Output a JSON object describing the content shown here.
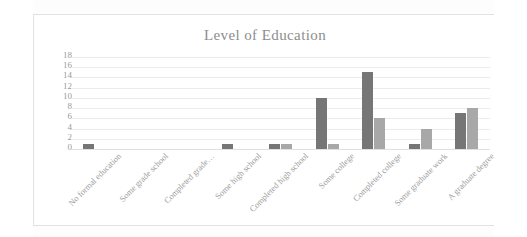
{
  "chart_data": {
    "type": "bar",
    "title": "Level of Education",
    "xlabel": "",
    "ylabel": "",
    "ylim": [
      0,
      18
    ],
    "grid": true,
    "legend": "none",
    "yticks": [
      18,
      16,
      14,
      12,
      10,
      8,
      6,
      4,
      2,
      0
    ],
    "categories": [
      "No formal education",
      "Some grade school",
      "Completed grade…",
      "Some high school",
      "Completed high school",
      "Some college",
      "Completed college",
      "Some graduate work",
      "A graduate degree"
    ],
    "series": [
      {
        "name": "Series 1",
        "color": "#767676",
        "values": [
          1,
          0,
          0,
          1,
          1,
          10,
          15,
          1,
          7
        ]
      },
      {
        "name": "Series 2",
        "color": "#a8a8a8",
        "values": [
          0,
          0,
          0,
          0,
          1,
          1,
          6,
          4,
          8
        ]
      }
    ]
  },
  "colors": {
    "series_dark": "#767676",
    "series_light": "#a8a8a8",
    "gridline": "#ececec",
    "axis_text": "#9a9a9a",
    "title_text": "#8d8d8d",
    "frame_border": "#e2e2e2",
    "background": "#ffffff"
  }
}
